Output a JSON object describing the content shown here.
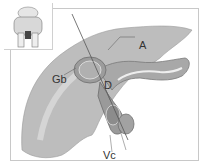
{
  "figure": {
    "type": "anatomical-diagram",
    "labels": [
      {
        "id": "A",
        "text": "A"
      },
      {
        "id": "Gb",
        "text": "Gb"
      },
      {
        "id": "D",
        "text": "D"
      },
      {
        "id": "Vc",
        "text": "Vc"
      }
    ],
    "colors": {
      "organ_fill": "#b9b9b9",
      "organ_dark": "#8e8e8e",
      "border": "#c8c8c8",
      "background": "#ffffff",
      "text": "#333333"
    },
    "inset": {
      "name": "orientation-thumbnail"
    }
  }
}
